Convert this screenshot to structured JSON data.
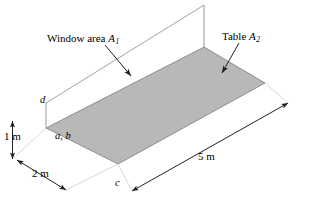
{
  "figure": {
    "type": "isometric-geometry-diagram",
    "background_color": "#ffffff",
    "line_color": "#231f20",
    "table_fill_color": "#b8b8b8",
    "window_fill_color": "#ffffff"
  },
  "callouts": [
    {
      "id": "window-area",
      "text_prefix": "Window area ",
      "symbol": "A",
      "subscript": "1",
      "x": 47,
      "y": 33
    },
    {
      "id": "table-area",
      "text_prefix": "Table ",
      "symbol": "A",
      "subscript": "2",
      "x": 222,
      "y": 31
    }
  ],
  "dimensions": [
    {
      "id": "height",
      "label": "1 m",
      "x": 4,
      "y": 131
    },
    {
      "id": "width",
      "label": "2 m",
      "x": 32,
      "y": 168
    },
    {
      "id": "length",
      "label": "5 m",
      "x": 198,
      "y": 151
    }
  ],
  "points": [
    {
      "id": "point-d",
      "label": "d",
      "x": 40,
      "y": 95
    },
    {
      "id": "point-ab",
      "label": "a, b",
      "x": 55,
      "y": 131
    },
    {
      "id": "point-c",
      "label": "c",
      "x": 115,
      "y": 178
    }
  ],
  "geometry": {
    "window_plane": "204,5 204,47 46,103 46,128",
    "window_outline_top": "204,5 46,103",
    "window_outline_bottom": "204,47 46,128",
    "window_left_edge": "46,103 46,128",
    "window_right_edge": "204,5 204,47",
    "table_surface": "46,128 204,47 265,83 118,164",
    "leader_window": "107,47 132,75",
    "leader_table": "237,44 222,72",
    "dim_height_line": "12,121 12,158",
    "dim_width_line": "18,161 64,188",
    "dim_length_line": "131,190 288,103"
  }
}
